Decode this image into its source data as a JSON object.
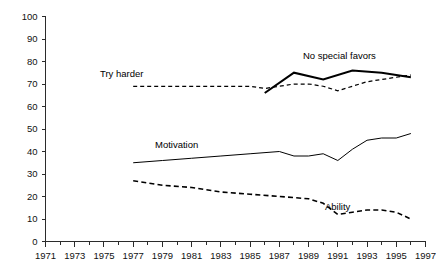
{
  "chart_data": {
    "type": "line",
    "title": "",
    "subtitle": "",
    "xlabel": "",
    "ylabel": "",
    "xlim": [
      1971,
      1997
    ],
    "ylim": [
      0,
      100
    ],
    "grid": false,
    "legend_position": "inline-labels",
    "x_ticks": [
      1971,
      1973,
      1975,
      1977,
      1979,
      1981,
      1983,
      1985,
      1987,
      1989,
      1991,
      1993,
      1995,
      1997
    ],
    "x_tick_labels": [
      "1971",
      "1973",
      "1975",
      "1977",
      "1979",
      "1981",
      "1983",
      "1985",
      "1987",
      "1989",
      "1991",
      "1993",
      "1995",
      "1997"
    ],
    "x_minor_ticks": [
      1972,
      1974,
      1976,
      1978,
      1980,
      1982,
      1984,
      1986,
      1988,
      1990,
      1992,
      1994,
      1996
    ],
    "y_ticks": [
      0,
      10,
      20,
      30,
      40,
      50,
      60,
      70,
      80,
      90,
      100
    ],
    "y_tick_labels": [
      "0",
      "10",
      "20",
      "30",
      "40",
      "50",
      "60",
      "70",
      "80",
      "90",
      "100"
    ],
    "series": [
      {
        "name": "Try harder",
        "label": "Try harder",
        "style": "dashed",
        "color": "#000000",
        "x": [
          1977,
          1979,
          1981,
          1983,
          1985,
          1986,
          1987,
          1988,
          1989,
          1990,
          1991,
          1992,
          1993,
          1994,
          1995,
          1996
        ],
        "values": [
          69,
          69,
          69,
          69,
          69,
          68,
          69,
          70,
          70,
          69,
          67,
          69,
          71,
          72,
          73,
          74
        ]
      },
      {
        "name": "No special favors",
        "label": "No special favors",
        "style": "solid-thick",
        "color": "#000000",
        "x": [
          1986,
          1988,
          1990,
          1992,
          1994,
          1996
        ],
        "values": [
          66,
          75,
          72,
          76,
          75,
          73
        ]
      },
      {
        "name": "Motivation",
        "label": "Motivation",
        "style": "solid-thin",
        "color": "#000000",
        "x": [
          1977,
          1979,
          1981,
          1983,
          1985,
          1987,
          1988,
          1989,
          1990,
          1991,
          1992,
          1993,
          1994,
          1995,
          1996
        ],
        "values": [
          35,
          36,
          37,
          38,
          39,
          40,
          38,
          38,
          39,
          36,
          41,
          45,
          46,
          46,
          48
        ]
      },
      {
        "name": "Ability",
        "label": "Ability",
        "style": "dashed-heavy",
        "color": "#000000",
        "x": [
          1977,
          1979,
          1981,
          1983,
          1985,
          1987,
          1989,
          1990,
          1991,
          1992,
          1993,
          1994,
          1995,
          1996
        ],
        "values": [
          27,
          25,
          24,
          22,
          21,
          20,
          19,
          17,
          12,
          13,
          14,
          14,
          13,
          10
        ]
      }
    ],
    "annotations": [
      {
        "text": "Try harder",
        "x_px": 100,
        "y_px": 75,
        "name": "try-harder-label"
      },
      {
        "text": "No special favors",
        "x_px": 303,
        "y_px": 57,
        "name": "no-special-favors-label"
      },
      {
        "text": "Motivation",
        "x_px": 155,
        "y_px": 146,
        "name": "motivation-label"
      },
      {
        "text": "Ability",
        "x_px": 325,
        "y_px": 208,
        "name": "ability-label"
      }
    ]
  },
  "axes": {
    "x_axis_name": "year-axis",
    "y_axis_name": "percent-axis"
  }
}
